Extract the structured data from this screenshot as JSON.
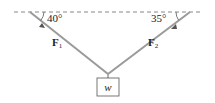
{
  "diagram": {
    "angles": {
      "left": "40°",
      "right": "35°"
    },
    "forces": {
      "left": "F",
      "left_sub": "1",
      "right": "F",
      "right_sub": "2"
    },
    "weight_label": "w",
    "colors": {
      "rope": "#9a9a9a",
      "ceiling": "#888888",
      "text": "#222222"
    }
  }
}
